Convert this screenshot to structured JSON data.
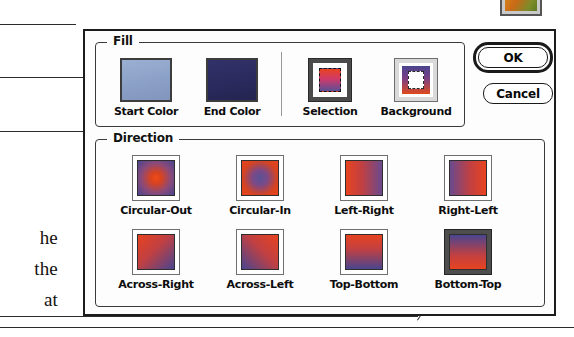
{
  "page": {
    "body_text_fragments": [
      "he",
      "the",
      "at"
    ]
  },
  "thumbnail": {
    "name": "image-thumbnail"
  },
  "dialog": {
    "fill_group": {
      "legend": "Fill",
      "items": [
        {
          "caption": "Start Color",
          "kind": "swatch",
          "color": "#8ba0c6"
        },
        {
          "caption": "End Color",
          "kind": "swatch",
          "color": "#2a2a5e"
        },
        {
          "caption": "Selection",
          "kind": "icon",
          "selected": false
        },
        {
          "caption": "Background",
          "kind": "icon",
          "selected": false
        }
      ]
    },
    "direction_group": {
      "legend": "Direction",
      "selected": "Bottom-Top",
      "items": [
        {
          "caption": "Circular-Out",
          "selected": false
        },
        {
          "caption": "Circular-In",
          "selected": false
        },
        {
          "caption": "Left-Right",
          "selected": false
        },
        {
          "caption": "Right-Left",
          "selected": false
        },
        {
          "caption": "Across-Right",
          "selected": false
        },
        {
          "caption": "Across-Left",
          "selected": false
        },
        {
          "caption": "Top-Bottom",
          "selected": false
        },
        {
          "caption": "Bottom-Top",
          "selected": true
        }
      ]
    },
    "buttons": {
      "ok_label": "OK",
      "cancel_label": "Cancel"
    }
  },
  "colors": {
    "gradient_start": "#e8431f",
    "gradient_end": "#4a4590",
    "start_color_swatch": "#8ba0c6",
    "end_color_swatch": "#2a2a5e",
    "selection_highlight": "#4d4d4d"
  }
}
